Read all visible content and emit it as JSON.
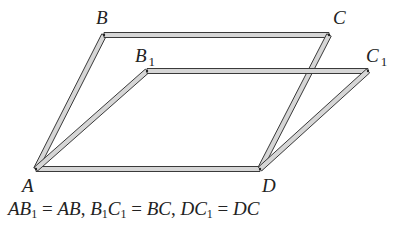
{
  "diagram": {
    "colors": {
      "bar_fill": "#d6d6d6",
      "bar_stroke": "#3a3a3a",
      "text": "#222222"
    },
    "points": {
      "A": {
        "label": "A",
        "x": 36,
        "y": 169
      },
      "B": {
        "label": "B",
        "x": 104,
        "y": 35
      },
      "C": {
        "label": "C",
        "x": 329,
        "y": 35
      },
      "D": {
        "label": "D",
        "x": 260,
        "y": 169
      },
      "B1": {
        "label": "B",
        "sub": "1",
        "x": 147,
        "y": 71
      },
      "C1": {
        "label": "C",
        "sub": "1",
        "x": 368,
        "y": 71
      }
    },
    "bars": [
      [
        "A",
        "B"
      ],
      [
        "B",
        "C"
      ],
      [
        "C",
        "D"
      ],
      [
        "A",
        "D"
      ],
      [
        "A",
        "B1"
      ],
      [
        "B1",
        "C1"
      ],
      [
        "D",
        "C1"
      ]
    ],
    "caption": {
      "parts": [
        {
          "t": "AB",
          "s": "1"
        },
        {
          "t": " = "
        },
        {
          "t": "AB"
        },
        {
          "t": ", "
        },
        {
          "t": "B",
          "s": "1"
        },
        {
          "t": "C",
          "s": "1"
        },
        {
          "t": " = "
        },
        {
          "t": "BC"
        },
        {
          "t": ", "
        },
        {
          "t": "DC",
          "s": "1"
        },
        {
          "t": " = "
        },
        {
          "t": "DC"
        }
      ],
      "text": "AB1 = AB, B1C1 = BC, DC1 = DC"
    }
  }
}
